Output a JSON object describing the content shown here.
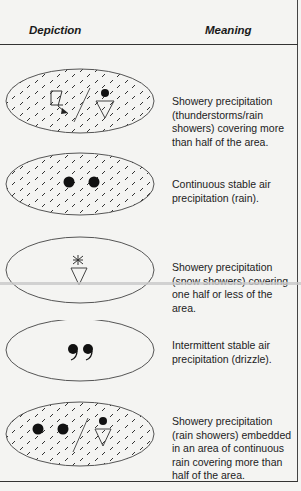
{
  "header": {
    "col1": "Depiction",
    "col2": "Meaning"
  },
  "rows": [
    {
      "symbol": "thunderstorm-rain-shower-shaded-ellipse-icon",
      "meaning": "Showery precipitation (thunderstorms/rain showers) covering more than half of the area."
    },
    {
      "symbol": "continuous-rain-shaded-ellipse-icon",
      "meaning": "Continuous stable air precipitation (rain)."
    },
    {
      "symbol": "snow-shower-ellipse-icon",
      "meaning": "Showery precipitation (snow showers) covering one half or less of the area."
    },
    {
      "symbol": "drizzle-ellipse-icon",
      "meaning": "Intermittent stable air precipitation (drizzle)."
    },
    {
      "symbol": "embedded-rain-shower-shaded-ellipse-icon",
      "meaning": "Showery precipitation (rain showers) embedded in an area of continuous rain covering more than half of the area."
    }
  ]
}
